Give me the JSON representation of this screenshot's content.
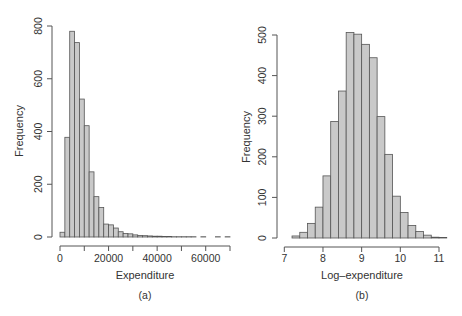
{
  "chart_data": [
    {
      "type": "bar",
      "subtype": "histogram",
      "panel_label": "(a)",
      "title": "",
      "xlabel": "Expenditure",
      "ylabel": "Frequency",
      "xlim": [
        0,
        70000
      ],
      "ylim": [
        0,
        800
      ],
      "x_ticks": [
        0,
        10000,
        20000,
        30000,
        40000,
        50000,
        60000,
        70000
      ],
      "x_tick_labels": [
        "0",
        "",
        "20000",
        "",
        "40000",
        "",
        "60000",
        ""
      ],
      "y_ticks": [
        0,
        200,
        400,
        600,
        800
      ],
      "y_tick_labels": [
        "0",
        "200",
        "400",
        "600",
        "800"
      ],
      "bin_width": 2000,
      "bin_start": 0,
      "values": [
        18,
        378,
        780,
        737,
        523,
        422,
        247,
        153,
        112,
        49,
        46,
        34,
        20,
        13,
        12,
        8,
        6,
        5,
        4,
        3,
        3,
        2,
        2,
        1,
        1,
        1,
        1,
        1,
        0,
        1,
        0,
        0,
        1,
        0,
        1
      ],
      "grid": false,
      "legend": null,
      "colors": {
        "fill": "#c9c9c9",
        "stroke": "#555555"
      }
    },
    {
      "type": "bar",
      "subtype": "histogram",
      "panel_label": "(b)",
      "title": "",
      "xlabel": "Log–expenditure",
      "ylabel": "Frequency",
      "xlim": [
        7,
        11
      ],
      "ylim": [
        0,
        500
      ],
      "x_ticks": [
        7,
        8,
        9,
        10,
        11
      ],
      "x_tick_labels": [
        "7",
        "8",
        "9",
        "10",
        "11"
      ],
      "y_ticks": [
        0,
        100,
        200,
        300,
        400,
        500
      ],
      "y_tick_labels": [
        "0",
        "100",
        "200",
        "300",
        "400",
        "500"
      ],
      "bin_width": 0.2,
      "bin_start": 7.2,
      "values": [
        5,
        14,
        36,
        76,
        153,
        287,
        362,
        506,
        502,
        477,
        444,
        299,
        206,
        103,
        63,
        31,
        16,
        7,
        2,
        1
      ],
      "grid": false,
      "legend": null,
      "colors": {
        "fill": "#c9c9c9",
        "stroke": "#555555"
      }
    }
  ],
  "panels": {
    "a": {
      "label": "(a)",
      "xlabel": "Expenditure",
      "ylabel": "Frequency"
    },
    "b": {
      "label": "(b)",
      "xlabel": "Log–expenditure",
      "ylabel": "Frequency"
    }
  }
}
